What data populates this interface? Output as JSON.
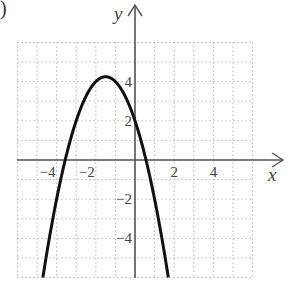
{
  "part_label": ")",
  "chart_data": {
    "type": "line",
    "title": "",
    "function": "y = -x^2 - 3x + 2",
    "xlabel": "x",
    "ylabel": "y",
    "xlim": [
      -6,
      6
    ],
    "ylim": [
      -6,
      6
    ],
    "grid": true,
    "grid_style": "dotted",
    "x_ticks": [
      {
        "value": -4,
        "label": "−4"
      },
      {
        "value": -2,
        "label": "−2"
      },
      {
        "value": 2,
        "label": "2"
      },
      {
        "value": 4,
        "label": "4"
      }
    ],
    "y_ticks": [
      {
        "value": 4,
        "label": "4"
      },
      {
        "value": 2,
        "label": "2"
      },
      {
        "value": -2,
        "label": "−2"
      },
      {
        "value": -4,
        "label": "−4"
      }
    ],
    "series": [
      {
        "name": "parabola",
        "x": [
          -4.7,
          -4.5,
          -4,
          -3.56,
          -3,
          -2.5,
          -2,
          -1.5,
          -1,
          -0.5,
          0,
          0.56,
          1,
          1.5,
          1.7
        ],
        "y": [
          -5.99,
          -4.75,
          -2,
          0,
          2,
          3.25,
          4,
          4.25,
          4,
          3.25,
          2,
          0,
          -2,
          -4.75,
          -5.99
        ]
      }
    ],
    "key_points": {
      "vertex": [
        -1.5,
        4.25
      ],
      "y_intercept": [
        0,
        2
      ],
      "x_intercepts": [
        -3.56,
        0.56
      ]
    }
  }
}
